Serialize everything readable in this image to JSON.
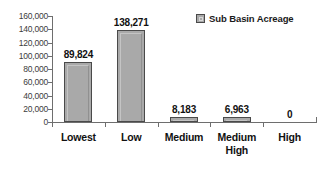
{
  "chart_data": {
    "type": "bar",
    "title": "",
    "xlabel": "",
    "ylabel": "",
    "categories": [
      "Lowest",
      "Low",
      "Medium",
      "Medium\nHigh",
      "High"
    ],
    "values": [
      89824,
      138271,
      8183,
      6963,
      0
    ],
    "value_labels": [
      "89,824",
      "138,271",
      "8,183",
      "6,963",
      "0"
    ],
    "series": [
      {
        "name": "Sub Basin Acreage",
        "values": [
          89824,
          138271,
          8183,
          6963,
          0
        ]
      }
    ],
    "ylim": [
      0,
      160000
    ],
    "ytick_values": [
      0,
      20000,
      40000,
      60000,
      80000,
      100000,
      120000,
      140000,
      160000
    ],
    "ytick_labels": [
      "0",
      "20,000",
      "40,000",
      "60,000",
      "80,000",
      "100,000",
      "120,000",
      "140,000",
      "160,000"
    ],
    "grid": false,
    "legend": {
      "position": "top-right",
      "entries": [
        {
          "label": "Sub Basin Acreage",
          "color": "#a9a9a9"
        }
      ]
    },
    "colors": {
      "bar_fill": "#a9a9a9",
      "bar_border": "#4a4a4a",
      "axis": "#6e6e6e",
      "text": "#111111",
      "background": "#ffffff"
    }
  }
}
